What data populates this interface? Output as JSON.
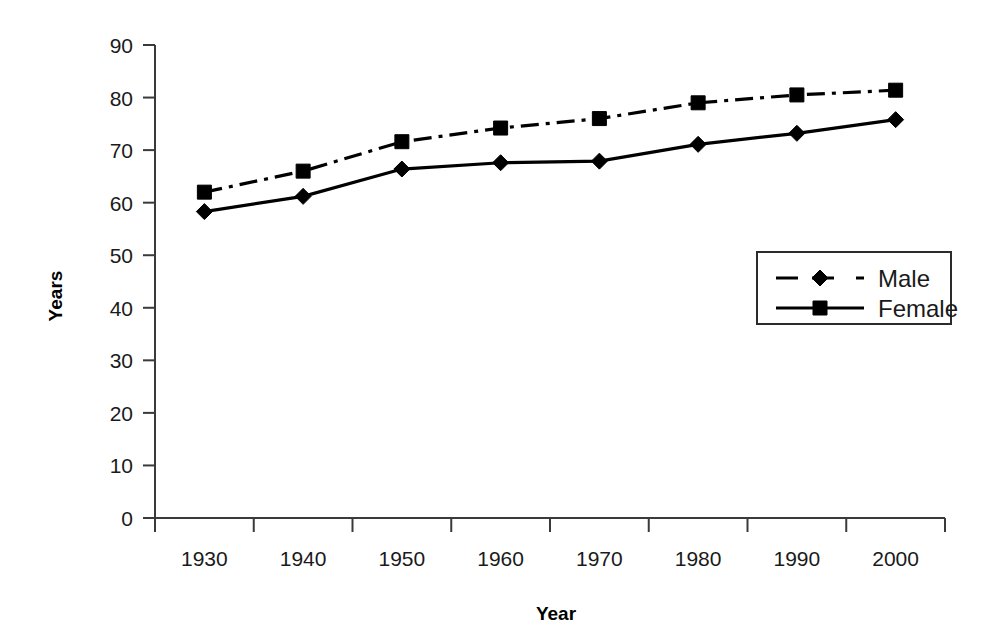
{
  "chart_data": {
    "type": "line",
    "title": "",
    "xlabel": "Year",
    "ylabel": "Years",
    "categories": [
      "1930",
      "1940",
      "1950",
      "1960",
      "1970",
      "1980",
      "1990",
      "2000"
    ],
    "x": [
      1930,
      1940,
      1950,
      1960,
      1970,
      1980,
      1990,
      2000
    ],
    "series": [
      {
        "name": "Male",
        "marker": "diamond",
        "line_style": "solid",
        "color": "#000000",
        "values": [
          58.3,
          61.2,
          66.4,
          67.6,
          67.9,
          71.1,
          73.2,
          75.8
        ]
      },
      {
        "name": "Female",
        "marker": "square",
        "line_style": "dash-dot",
        "color": "#000000",
        "values": [
          62.0,
          66.0,
          71.6,
          74.2,
          76.0,
          79.0,
          80.5,
          81.4
        ]
      }
    ],
    "ylim": [
      0,
      90
    ],
    "yticks": [
      0,
      10,
      20,
      30,
      40,
      50,
      60,
      70,
      80,
      90
    ],
    "ytick_labels": [
      "0",
      "10",
      "20",
      "30",
      "40",
      "50",
      "60",
      "70",
      "80",
      "90"
    ],
    "grid": false,
    "legend_position": "center-right",
    "legend_entries": [
      "Male",
      "Female"
    ]
  },
  "axes": {
    "y_title": "Years",
    "x_title": "Year"
  },
  "legend": {
    "items": [
      {
        "label": "Male"
      },
      {
        "label": "Female"
      }
    ]
  }
}
